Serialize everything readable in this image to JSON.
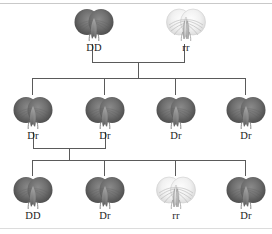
{
  "figure": {
    "name": "pea-flower-pedigree",
    "background_color": "#ffffff",
    "line_color": "#5a5a5a",
    "rule_color": "#c9c9c9",
    "label_color": "#1b1b1b",
    "dark_flower_color": "#6e6e6e",
    "white_flower_color": "#f2f2f2"
  },
  "generations": [
    {
      "name": "parent-generation",
      "row": 0,
      "individuals": [
        {
          "label": "DD",
          "phenotype": "dark",
          "x": 72,
          "y": 8
        },
        {
          "label": "rr",
          "phenotype": "white",
          "x": 164,
          "y": 8
        }
      ]
    },
    {
      "name": "f1-generation",
      "row": 1,
      "individuals": [
        {
          "label": "Dr",
          "phenotype": "dark",
          "x": 11,
          "y": 96
        },
        {
          "label": "Dr",
          "phenotype": "dark",
          "x": 83,
          "y": 96
        },
        {
          "label": "Dr",
          "phenotype": "dark",
          "x": 154,
          "y": 96
        },
        {
          "label": "Dr",
          "phenotype": "dark",
          "x": 224,
          "y": 96
        }
      ]
    },
    {
      "name": "f2-generation",
      "row": 2,
      "individuals": [
        {
          "label": "DD",
          "phenotype": "dark",
          "x": 11,
          "y": 176
        },
        {
          "label": "Dr",
          "phenotype": "dark",
          "x": 83,
          "y": 176
        },
        {
          "label": "rr",
          "phenotype": "white",
          "x": 154,
          "y": 176
        },
        {
          "label": "Dr",
          "phenotype": "dark",
          "x": 224,
          "y": 176
        }
      ]
    }
  ],
  "connectors": {
    "parent_cross": {
      "name": "parent-cross-connector",
      "left_stub_x": 92,
      "right_stub_x": 184,
      "bar_y": 62,
      "stub_top_y": 44,
      "center_x": 138,
      "drop_bottom_y": 78
    },
    "f1_distribution": {
      "name": "f1-distribution-bar",
      "bar_y": 78,
      "bar_left": 32,
      "bar_right": 245,
      "drop_xs": [
        32,
        104,
        175,
        245
      ],
      "drop_bottom_y": 95
    },
    "f1_cross": {
      "name": "f1-cross-connector",
      "left_stub_x": 33,
      "right_stub_x": 105,
      "bar_y": 148,
      "stub_top_y": 132,
      "center_x": 69,
      "drop_bottom_y": 160
    },
    "f2_distribution": {
      "name": "f2-distribution-bar",
      "bar_y": 160,
      "bar_left": 32,
      "bar_right": 245,
      "drop_xs": [
        32,
        104,
        175,
        245
      ],
      "drop_bottom_y": 176
    }
  }
}
